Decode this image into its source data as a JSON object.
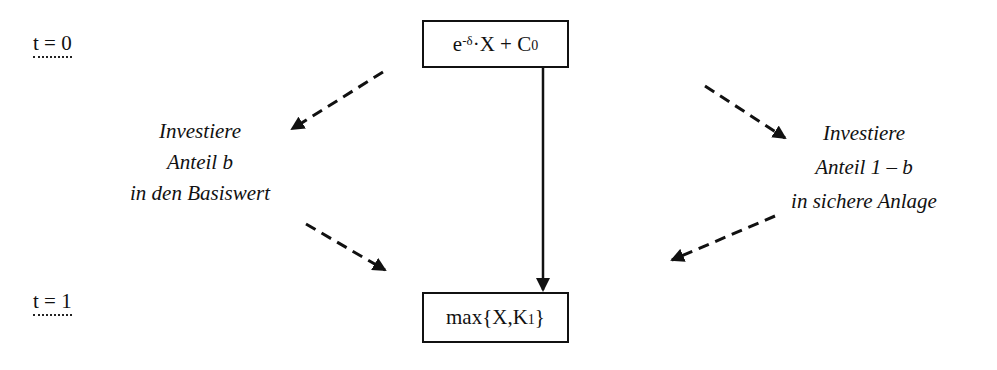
{
  "time_labels": {
    "t0": "t = 0",
    "t1": "t = 1"
  },
  "boxes": {
    "top": {
      "base": "e",
      "exponent": "-δ",
      "middle": "·X + C",
      "subscript": "0"
    },
    "bottom": {
      "prefix": "max{X,K",
      "subscript": "1",
      "suffix": "}"
    }
  },
  "left_note": {
    "lines": [
      "Investiere",
      "Anteil b",
      "in den Basiswert"
    ]
  },
  "right_note": {
    "lines": [
      "Investiere",
      "Anteil 1 – b",
      "in sichere Anlage"
    ]
  },
  "arrows": [
    {
      "id": "top-left-dashed",
      "style": "dashed"
    },
    {
      "id": "bottom-left-dashed",
      "style": "dashed"
    },
    {
      "id": "top-right-dashed",
      "style": "dashed"
    },
    {
      "id": "bottom-right-dashed",
      "style": "dashed"
    },
    {
      "id": "center-solid",
      "style": "solid"
    }
  ],
  "colors": {
    "line": "#111111",
    "background": "#ffffff"
  }
}
